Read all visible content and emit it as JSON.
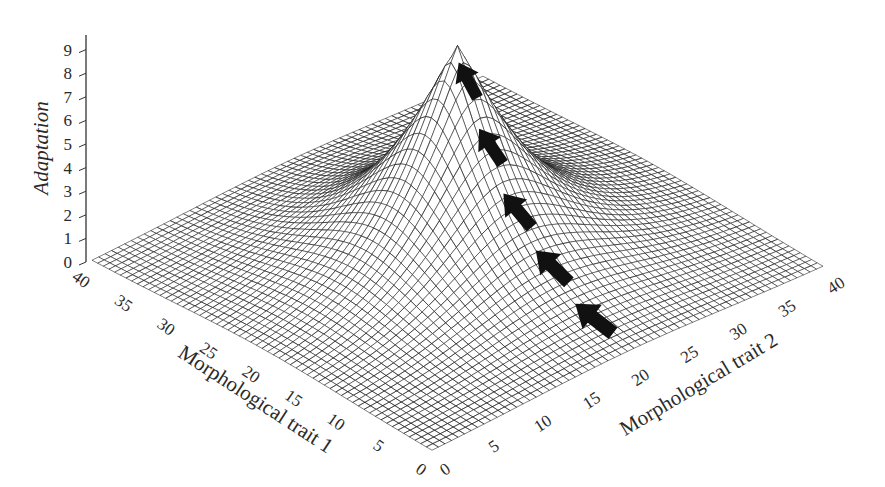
{
  "chart_data": {
    "type": "surface3d",
    "title": "",
    "zlabel": "Adaptation",
    "xlabel": "Morphological trait 1",
    "ylabel": "Morphological trait 2",
    "z_ticks": [
      "0",
      "1",
      "2",
      "3",
      "4",
      "5",
      "6",
      "7",
      "8",
      "9"
    ],
    "x_ticks": [
      "0",
      "5",
      "10",
      "15",
      "20",
      "25",
      "30",
      "35",
      "40"
    ],
    "y_ticks": [
      "0",
      "5",
      "10",
      "15",
      "20",
      "25",
      "30",
      "35",
      "40"
    ],
    "xlim": [
      0,
      40
    ],
    "ylim": [
      0,
      40
    ],
    "zlim": [
      0,
      9.5
    ],
    "grid_resolution": 60,
    "surface": {
      "description": "Single sharp peak of adaptation centered near (20,20); falls off steeply, flat near 0 at the edges",
      "peak": {
        "x": 20,
        "y": 20,
        "z": 9.5
      },
      "base_value": 0
    },
    "annotations": {
      "arrows": {
        "count": 5,
        "description": "Black arrows climbing the ridge of the surface toward the peak",
        "color": "#111111"
      }
    },
    "colors": {
      "mesh_line": "#1a1a1a",
      "surface_fill": "#ffffff",
      "background": "#ffffff"
    }
  }
}
